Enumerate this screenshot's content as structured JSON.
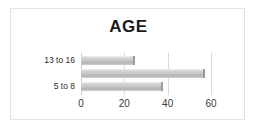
{
  "chart_data": {
    "type": "bar",
    "orientation": "horizontal",
    "title": "AGE",
    "xlabel": "",
    "ylabel": "",
    "categories": [
      "13 to 16",
      "",
      "5 to 8"
    ],
    "values": [
      25,
      57,
      38
    ],
    "xlim": [
      0,
      60
    ],
    "xticks": [
      0,
      20,
      40,
      60
    ],
    "xtick_labels": [
      "0",
      "20",
      "40",
      "60"
    ],
    "grid": true,
    "legend": false,
    "bar_color": "#c8c8c8",
    "bar_edge_color": "#9b9b9b",
    "gridline_color": "#d9d9d9",
    "frame_color": "#e3e3e3",
    "title_color": "#1a1a1a",
    "background": "#ffffff"
  },
  "chart": {
    "title": "AGE",
    "bars": [
      {
        "label": "13 to 16",
        "value": 25
      },
      {
        "label": "",
        "value": 57
      },
      {
        "label": "5 to 8",
        "value": 38
      }
    ],
    "axis": {
      "ticks": [
        "0",
        "20",
        "40",
        "60"
      ],
      "tick_values": [
        0,
        20,
        40,
        60
      ],
      "max": 60
    },
    "category_labels": [
      "13 to 16",
      "5 to 8"
    ]
  }
}
